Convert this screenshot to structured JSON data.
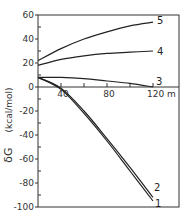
{
  "chart_data": {
    "type": "line",
    "title": "",
    "xlabel": "m",
    "ylabel": "δG (kcal/mol)",
    "xlim": [
      20,
      142
    ],
    "ylim": [
      -100,
      60
    ],
    "grid": false,
    "legend_position": "inline labels at line ends",
    "x_ticks": [
      40,
      80,
      120
    ],
    "x_tick_labels": [
      "40",
      "80",
      "120 m"
    ],
    "y_ticks": [
      60,
      40,
      20,
      0,
      -20,
      -40,
      -60,
      -80,
      -100
    ],
    "y_tick_labels": [
      "60",
      "40",
      "20",
      "0",
      "-20",
      "-40",
      "-60",
      "-80",
      "-100"
    ],
    "x": [
      20,
      40,
      60,
      80,
      100,
      120
    ],
    "series": [
      {
        "name": "1",
        "values": [
          8,
          -2,
          -22,
          -45,
          -70,
          -95
        ]
      },
      {
        "name": "2",
        "values": [
          8,
          -1,
          -20,
          -43,
          -67,
          -92
        ]
      },
      {
        "name": "3",
        "values": [
          8,
          8,
          7,
          5,
          3,
          0
        ]
      },
      {
        "name": "4",
        "values": [
          18,
          23,
          26,
          28,
          29,
          30
        ]
      },
      {
        "name": "5",
        "values": [
          22,
          32,
          40,
          46,
          51,
          54
        ]
      }
    ]
  },
  "labels": {
    "y_axis_symbol": "δG",
    "y_axis_units": "(kcal/mol)",
    "x_axis_unit_suffix": "m"
  }
}
